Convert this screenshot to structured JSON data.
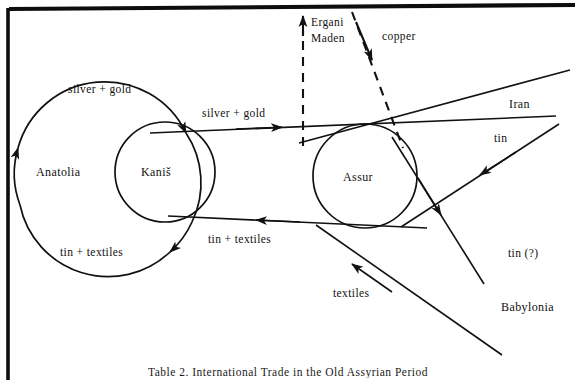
{
  "figure": {
    "caption": "Table 2.  International Trade in the Old Assyrian Period",
    "frame_color": "#000000",
    "ink_color": "#111111",
    "background": "#ffffff",
    "width": 576,
    "height": 380
  },
  "nodes": {
    "anatolia": {
      "label": "Anatolia",
      "cx": 108,
      "cy": 172,
      "r": 90
    },
    "kanis": {
      "label": "Kaniš",
      "cx": 165,
      "cy": 172,
      "r": 50
    },
    "assur": {
      "label": "Assur",
      "cx": 365,
      "cy": 176,
      "r": 52
    },
    "ergani_maden": {
      "label": "Ergani\nMaden",
      "line1": "Ergani",
      "line2": "Maden"
    },
    "iran": {
      "label": "Iran"
    },
    "babylonia": {
      "label": "Babylonia"
    }
  },
  "flows": [
    {
      "id": "silver-gold-internal",
      "label": "silver  +  gold",
      "from": "Anatolia",
      "to": "Kaniš",
      "style": "solid"
    },
    {
      "id": "tin-textiles-internal",
      "label": "tin  +  textiles",
      "from": "Kaniš",
      "to": "Anatolia",
      "style": "solid"
    },
    {
      "id": "silver-gold-export",
      "label": "silver  +  gold",
      "from": "Kaniš",
      "to": "Assur",
      "style": "solid"
    },
    {
      "id": "tin-textiles-import",
      "label": "tin  +  textiles",
      "from": "Assur",
      "to": "Kaniš",
      "style": "solid"
    },
    {
      "id": "copper",
      "label": "copper",
      "from": "Ergani Maden",
      "to": "Assur",
      "style": "dashed"
    },
    {
      "id": "ergani-maden-route",
      "label": "Ergani Maden",
      "from": "Assur",
      "to": "Ergani Maden",
      "style": "dashed"
    },
    {
      "id": "tin-iran",
      "label": "tin",
      "from": "Iran",
      "to": "Assur",
      "style": "solid"
    },
    {
      "id": "tin-question",
      "label": "tin  (?)",
      "from": "Assur",
      "to": "Babylonia",
      "style": "solid"
    },
    {
      "id": "textiles",
      "label": "textiles",
      "from": "Babylonia",
      "to": "Assur",
      "style": "solid"
    }
  ],
  "labels": {
    "silver_gold_left": "silver  +  gold",
    "silver_gold_mid": "silver  +  gold",
    "tin_textiles_left": "tin  +  textiles",
    "tin_textiles_mid": "tin  +  textiles",
    "copper": "copper",
    "ergani_line1": "Ergani",
    "ergani_line2": "Maden",
    "iran": "Iran",
    "tin": "tin",
    "tin_question": "tin  (?)",
    "babylonia": "Babylonia",
    "textiles": "textiles",
    "anatolia": "Anatolia",
    "kanis": "Kaniš",
    "assur": "Assur"
  }
}
